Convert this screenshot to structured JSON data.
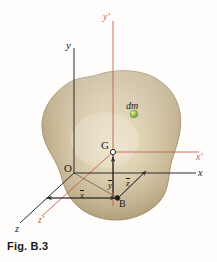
{
  "figure": {
    "caption": "Fig. B.3",
    "title": "Fig. B.3"
  },
  "colors": {
    "body_fill_light": "#e2d5b8",
    "body_fill_mid": "#c9b894",
    "body_fill_dark": "#a9966f",
    "body_edge": "#8d7b56",
    "axis_dark": "#2b2b2b",
    "axis_primed": "#c4634b",
    "dm_marker": "#86ae3f",
    "caption_text": "#1a1a1a",
    "background": "#fefdfb"
  },
  "labels": {
    "y_axis": "y",
    "y_prime_axis": "y'",
    "x_axis": "x",
    "x_prime_axis": "x'",
    "z_axis": "z",
    "z_prime_axis": "z'",
    "origin": "O",
    "centroid": "G",
    "point_b": "B",
    "mass_element": "dm",
    "x_bar": "x",
    "y_bar": "y",
    "z_bar": "z"
  },
  "markers": {
    "centroid_point": "open-circle",
    "point_b": "filled-dot",
    "mass_element_point": "green-dot"
  },
  "dimension_arrows": [
    {
      "name": "x-bar",
      "label": "x",
      "from": "z-axis",
      "to": "B",
      "overbar": true
    },
    {
      "name": "y-bar",
      "label": "y",
      "from": "B",
      "to": "G",
      "overbar": true
    },
    {
      "name": "z-bar",
      "label": "z",
      "from": "B",
      "to": "x-axis",
      "overbar": true
    }
  ]
}
